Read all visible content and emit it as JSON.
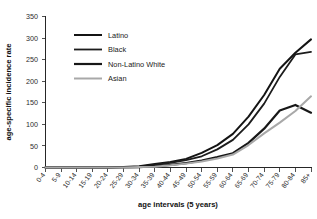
{
  "chart_data": {
    "type": "line",
    "title": "",
    "xlabel": "age intervals (5 years)",
    "ylabel": "age-specific incidence rate",
    "grid": false,
    "legend_position": "upper-left-inside",
    "ylim": [
      0,
      350
    ],
    "yticks": [
      0,
      50,
      100,
      150,
      200,
      250,
      300,
      350
    ],
    "categories": [
      "0-4",
      "5-9",
      "10-14",
      "15-19",
      "20-24",
      "25-29",
      "30-34",
      "35-39",
      "40-44",
      "45-49",
      "50-54",
      "55-59",
      "60-64",
      "65-69",
      "70-74",
      "75-79",
      "80-84",
      "85+"
    ],
    "series": [
      {
        "name": "Latino",
        "color": "#141414",
        "width": 2.0,
        "values": [
          0,
          0,
          0,
          0,
          0,
          1,
          3,
          8,
          13,
          20,
          34,
          52,
          78,
          118,
          168,
          229,
          266,
          297
        ]
      },
      {
        "name": "Black",
        "color": "#1c1c1c",
        "width": 1.8,
        "values": [
          0,
          0,
          0,
          0,
          0,
          1,
          2,
          6,
          11,
          17,
          26,
          42,
          64,
          100,
          148,
          210,
          262,
          268
        ]
      },
      {
        "name": "Non-Latino White",
        "color": "#171717",
        "width": 2.2,
        "values": [
          0,
          0,
          0,
          0,
          0,
          0,
          1,
          3,
          6,
          10,
          16,
          24,
          33,
          57,
          90,
          132,
          145,
          127
        ]
      },
      {
        "name": "Asian",
        "color": "#a8a8a8",
        "width": 2.0,
        "values": [
          0,
          0,
          0,
          0,
          0,
          0,
          1,
          2,
          5,
          9,
          14,
          21,
          30,
          52,
          79,
          104,
          131,
          165
        ]
      }
    ]
  },
  "legend": {
    "entries": [
      {
        "label": "Latino"
      },
      {
        "label": "Black"
      },
      {
        "label": "Non-Latino White"
      },
      {
        "label": "Asian"
      }
    ]
  }
}
